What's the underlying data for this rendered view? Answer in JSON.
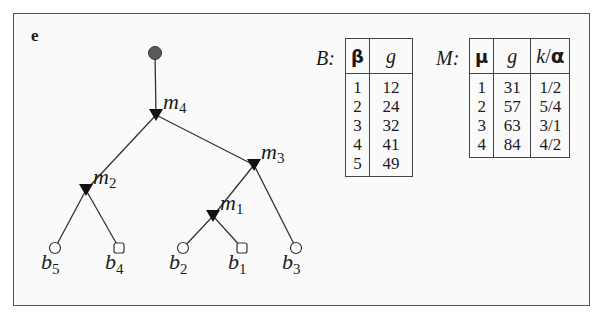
{
  "panel": {
    "label": "e"
  },
  "tree": {
    "root": {
      "id": "root",
      "x": 155,
      "y": 53,
      "shape": "filled-circle"
    },
    "internal_nodes": [
      {
        "id": "m4",
        "label": "m",
        "sub": "4",
        "x": 156,
        "y": 115
      },
      {
        "id": "m3",
        "label": "m",
        "sub": "3",
        "x": 254,
        "y": 165
      },
      {
        "id": "m2",
        "label": "m",
        "sub": "2",
        "x": 86,
        "y": 190
      },
      {
        "id": "m1",
        "label": "m",
        "sub": "1",
        "x": 213,
        "y": 216
      }
    ],
    "leaves": [
      {
        "id": "b5",
        "label": "b",
        "sub": "5",
        "x": 55,
        "y": 248,
        "shape": "circle"
      },
      {
        "id": "b4",
        "label": "b",
        "sub": "4",
        "x": 119,
        "y": 248,
        "shape": "square"
      },
      {
        "id": "b2",
        "label": "b",
        "sub": "2",
        "x": 183,
        "y": 248,
        "shape": "circle"
      },
      {
        "id": "b1",
        "label": "b",
        "sub": "1",
        "x": 242,
        "y": 248,
        "shape": "square"
      },
      {
        "id": "b3",
        "label": "b",
        "sub": "3",
        "x": 296,
        "y": 248,
        "shape": "circle"
      }
    ],
    "edges": [
      [
        "root",
        "m4"
      ],
      [
        "m4",
        "m2"
      ],
      [
        "m4",
        "m3"
      ],
      [
        "m3",
        "m1"
      ],
      [
        "m3",
        "b3"
      ],
      [
        "m2",
        "b5"
      ],
      [
        "m2",
        "b4"
      ],
      [
        "m1",
        "b2"
      ],
      [
        "m1",
        "b1"
      ]
    ]
  },
  "table_B": {
    "name": "B:",
    "headers": [
      "β",
      "g"
    ],
    "rows": [
      [
        "1",
        "12"
      ],
      [
        "2",
        "24"
      ],
      [
        "3",
        "32"
      ],
      [
        "4",
        "41"
      ],
      [
        "5",
        "49"
      ]
    ]
  },
  "table_M": {
    "name": "M:",
    "headers": [
      "μ",
      "g",
      "k/α"
    ],
    "header_k": "k",
    "header_slash": "/",
    "header_alpha": "α",
    "rows": [
      [
        "1",
        "31",
        "1/2"
      ],
      [
        "2",
        "57",
        "5/4"
      ],
      [
        "3",
        "63",
        "3/1"
      ],
      [
        "4",
        "84",
        "4/2"
      ]
    ]
  }
}
